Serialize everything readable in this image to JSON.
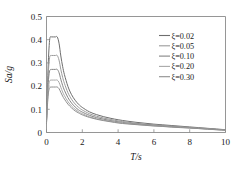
{
  "chart_data": {
    "type": "line",
    "title": "",
    "xlabel": "T/s",
    "ylabel": "Sa/g",
    "xlim": [
      0,
      10
    ],
    "ylim": [
      0,
      0.5
    ],
    "grid": false,
    "legend_position": "top-right",
    "xticks": [
      "0",
      "2",
      "4",
      "6",
      "8",
      "10"
    ],
    "xtick_values": [
      0,
      2,
      4,
      6,
      8,
      10
    ],
    "yticks": [
      "0",
      "0.1",
      "0.2",
      "0.3",
      "0.4",
      "0.5"
    ],
    "ytick_values": [
      0,
      0.1,
      0.2,
      0.3,
      0.4,
      0.5
    ],
    "x": [
      0.0,
      0.05,
      0.1,
      0.15,
      0.2,
      0.3,
      0.4,
      0.5,
      0.6,
      0.7,
      0.8,
      0.9,
      1.0,
      1.2,
      1.4,
      1.6,
      1.8,
      2.0,
      2.4,
      2.8,
      3.2,
      3.6,
      4.0,
      4.5,
      5.0,
      5.5,
      6.0,
      6.5,
      7.0,
      7.5,
      8.0,
      8.5,
      9.0,
      9.5,
      10.0
    ],
    "series": [
      {
        "name": "ξ=0.02",
        "color": "#6e6e6e",
        "values": [
          0.055,
          0.185,
          0.3,
          0.375,
          0.41,
          0.412,
          0.412,
          0.412,
          0.412,
          0.385,
          0.33,
          0.285,
          0.25,
          0.198,
          0.163,
          0.139,
          0.121,
          0.108,
          0.089,
          0.077,
          0.068,
          0.061,
          0.055,
          0.049,
          0.044,
          0.04,
          0.036,
          0.033,
          0.03,
          0.027,
          0.024,
          0.021,
          0.018,
          0.015,
          0.012
        ]
      },
      {
        "name": "ξ=0.05",
        "color": "#9b9b9b",
        "values": [
          0.05,
          0.16,
          0.255,
          0.308,
          0.33,
          0.332,
          0.332,
          0.332,
          0.332,
          0.312,
          0.272,
          0.238,
          0.212,
          0.171,
          0.143,
          0.123,
          0.108,
          0.097,
          0.081,
          0.07,
          0.062,
          0.056,
          0.05,
          0.045,
          0.04,
          0.036,
          0.033,
          0.03,
          0.027,
          0.025,
          0.022,
          0.019,
          0.017,
          0.014,
          0.011
        ]
      },
      {
        "name": "ξ=0.10",
        "color": "#848484",
        "values": [
          0.046,
          0.14,
          0.216,
          0.255,
          0.27,
          0.272,
          0.272,
          0.272,
          0.272,
          0.258,
          0.229,
          0.203,
          0.182,
          0.15,
          0.127,
          0.11,
          0.097,
          0.088,
          0.074,
          0.064,
          0.057,
          0.051,
          0.046,
          0.041,
          0.037,
          0.034,
          0.031,
          0.028,
          0.026,
          0.023,
          0.021,
          0.018,
          0.016,
          0.013,
          0.011
        ]
      },
      {
        "name": "ξ=0.20",
        "color": "#a8a8a8",
        "values": [
          0.042,
          0.124,
          0.186,
          0.215,
          0.225,
          0.226,
          0.226,
          0.226,
          0.226,
          0.216,
          0.195,
          0.175,
          0.159,
          0.133,
          0.114,
          0.1,
          0.089,
          0.081,
          0.068,
          0.059,
          0.053,
          0.048,
          0.043,
          0.039,
          0.035,
          0.032,
          0.029,
          0.027,
          0.024,
          0.022,
          0.02,
          0.017,
          0.015,
          0.012,
          0.01
        ]
      },
      {
        "name": "ξ=0.30",
        "color": "#8f8f8f",
        "values": [
          0.039,
          0.113,
          0.166,
          0.188,
          0.195,
          0.196,
          0.196,
          0.196,
          0.196,
          0.189,
          0.173,
          0.157,
          0.144,
          0.122,
          0.106,
          0.093,
          0.084,
          0.076,
          0.065,
          0.057,
          0.051,
          0.046,
          0.041,
          0.037,
          0.034,
          0.031,
          0.028,
          0.026,
          0.023,
          0.021,
          0.019,
          0.017,
          0.014,
          0.012,
          0.01
        ]
      }
    ]
  }
}
